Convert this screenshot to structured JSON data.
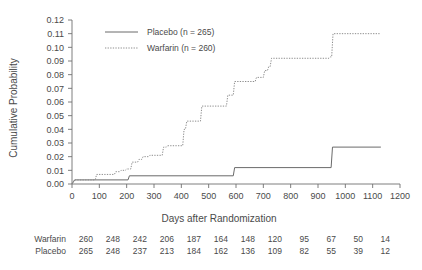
{
  "chart_data": {
    "type": "line",
    "subtype": "kaplan-meier-cumulative-incidence-step",
    "title": "",
    "xlabel": "Days after Randomization",
    "ylabel": "Cumulative Probability",
    "xlim": [
      0,
      1200
    ],
    "ylim": [
      0.0,
      0.12
    ],
    "xticks": [
      0,
      100,
      200,
      300,
      400,
      500,
      600,
      700,
      800,
      900,
      1000,
      1100,
      1200
    ],
    "xtick_labels": [
      "0",
      "100",
      "200",
      "300",
      "400",
      "500",
      "600",
      "700",
      "800",
      "900",
      "1000",
      "1100",
      "1200"
    ],
    "yticks": [
      0.0,
      0.01,
      0.02,
      0.03,
      0.04,
      0.05,
      0.06,
      0.07,
      0.08,
      0.09,
      0.1,
      0.11,
      0.12
    ],
    "ytick_labels": [
      "0.00",
      "0.01",
      "0.02",
      "0.03",
      "0.04",
      "0.05",
      "0.06",
      "0.07",
      "0.08",
      "0.09",
      "0.10",
      "0.11",
      "0.12"
    ],
    "grid": false,
    "legend_position": "top-left",
    "series": [
      {
        "name": "Placebo (n = 265)",
        "style": "solid",
        "color": "#6a6a6a",
        "x": [
          0,
          10,
          205,
          210,
          590,
          595,
          948,
          953,
          1130
        ],
        "y": [
          0.0,
          0.003,
          0.003,
          0.006,
          0.006,
          0.012,
          0.012,
          0.027,
          0.027
        ]
      },
      {
        "name": "Warfarin (n = 260)",
        "style": "dotted",
        "color": "#8d8d8d",
        "x": [
          0,
          8,
          85,
          90,
          155,
          160,
          175,
          180,
          195,
          200,
          215,
          220,
          240,
          245,
          255,
          260,
          280,
          285,
          330,
          335,
          345,
          350,
          405,
          410,
          415,
          420,
          470,
          475,
          565,
          570,
          590,
          595,
          670,
          675,
          700,
          705,
          715,
          720,
          725,
          730,
          940,
          945,
          950,
          955,
          1130
        ],
        "y": [
          0.0,
          0.003,
          0.003,
          0.007,
          0.007,
          0.009,
          0.009,
          0.01,
          0.01,
          0.011,
          0.011,
          0.016,
          0.016,
          0.018,
          0.018,
          0.02,
          0.02,
          0.021,
          0.021,
          0.027,
          0.027,
          0.028,
          0.028,
          0.04,
          0.04,
          0.046,
          0.046,
          0.057,
          0.057,
          0.065,
          0.065,
          0.075,
          0.075,
          0.078,
          0.078,
          0.083,
          0.083,
          0.086,
          0.086,
          0.092,
          0.092,
          0.093,
          0.093,
          0.11,
          0.11
        ]
      }
    ]
  },
  "legend": {
    "entries": [
      {
        "label": "Placebo (n = 265)",
        "style": "solid"
      },
      {
        "label": "Warfarin (n = 260)",
        "style": "dotted"
      }
    ]
  },
  "risk_table": {
    "rows": [
      {
        "label": "Warfarin",
        "counts": [
          "260",
          "248",
          "242",
          "206",
          "187",
          "164",
          "148",
          "120",
          "95",
          "67",
          "50",
          "14"
        ]
      },
      {
        "label": "Placebo",
        "counts": [
          "265",
          "248",
          "237",
          "213",
          "184",
          "162",
          "136",
          "109",
          "82",
          "55",
          "39",
          "12"
        ]
      }
    ]
  }
}
